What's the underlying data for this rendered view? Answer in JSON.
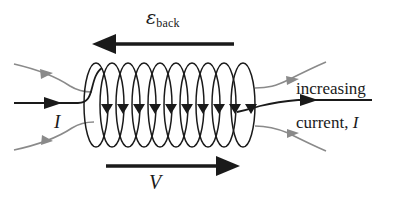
{
  "diagram": {
    "background_color": "#ffffff",
    "wire_color": "#1a1a1a",
    "field_line_color": "#8a8a8a",
    "labels": {
      "emf_symbol": "ε",
      "emf_subscript": "back",
      "voltage": "V",
      "current_left": "I",
      "increasing": "increasing",
      "current_right": "current, ",
      "current_right_symbol": "I"
    },
    "coil": {
      "turns": 10,
      "turn_arrow_count": 10,
      "arrow_direction": "down"
    },
    "arrows": {
      "emf_direction": "left",
      "voltage_direction": "right",
      "current_left_direction": "right",
      "current_right_direction": "right"
    },
    "field_lines": {
      "left_count": 2,
      "right_count": 2,
      "direction": "right"
    }
  }
}
